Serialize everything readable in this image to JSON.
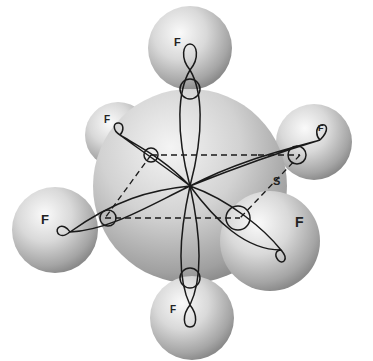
{
  "diagram": {
    "central_atom": {
      "label": "S",
      "x": 190,
      "y": 186,
      "r": 97
    },
    "atoms": [
      {
        "id": "top",
        "label": "F",
        "cx": 190,
        "cy": 48,
        "r": 42,
        "lx": 174,
        "ly": 46,
        "size": 11
      },
      {
        "id": "back-left",
        "label": "F",
        "cx": 118,
        "cy": 135,
        "r": 33,
        "lx": 104,
        "ly": 123,
        "size": 10
      },
      {
        "id": "back-right",
        "label": "F",
        "cx": 314,
        "cy": 142,
        "r": 38,
        "lx": 318,
        "ly": 131,
        "size": 9
      },
      {
        "id": "left",
        "label": "F",
        "cx": 55,
        "cy": 230,
        "r": 43,
        "lx": 41,
        "ly": 224,
        "size": 13
      },
      {
        "id": "front-right",
        "label": "F",
        "cx": 270,
        "cy": 241,
        "r": 50,
        "lx": 295,
        "ly": 227,
        "size": 14
      },
      {
        "id": "bottom",
        "label": "F",
        "cx": 192,
        "cy": 318,
        "r": 42,
        "lx": 170,
        "ly": 313,
        "size": 10
      }
    ],
    "sulfur_label": {
      "text": "S",
      "x": 273,
      "y": 185
    },
    "colors": {
      "sphere_light": "#f2f2f2",
      "sphere_mid": "#c8c8c8",
      "sphere_dark": "#8f8f8f",
      "line": "#1a1a1a",
      "background": "#ffffff"
    }
  }
}
